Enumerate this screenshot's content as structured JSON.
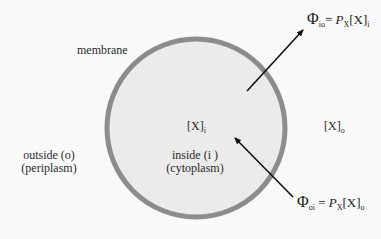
{
  "diagram": {
    "membrane_label": "membrane",
    "inside": {
      "concentration_symbol": "[X]",
      "concentration_subscript": "i",
      "label_line1": "inside (i )",
      "label_line2": "(cytoplasm)"
    },
    "outside": {
      "concentration_symbol": "[X]",
      "concentration_subscript": "o",
      "label_line1": "outside (o)",
      "label_line2": "(periplasm)"
    },
    "flux_out": {
      "phi": "Φ",
      "phi_subscript": "io",
      "equals": "= ",
      "P": "P",
      "P_subscript": "X",
      "conc": "[X]",
      "conc_subscript": "i"
    },
    "flux_in": {
      "phi": "Φ",
      "phi_subscript": "oi",
      "equals": " = ",
      "P": "P",
      "P_subscript": "X",
      "conc": "[X]",
      "conc_subscript": "o"
    },
    "colors": {
      "background": "#f9f9f9",
      "cell_fill": "#ebebeb",
      "membrane": "#8c8c8c",
      "arrow": "#111111"
    }
  }
}
